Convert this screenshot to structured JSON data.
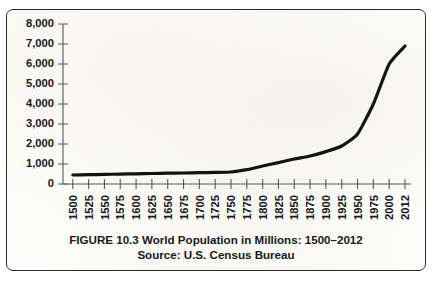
{
  "figure": {
    "caption_title": "FIGURE 10.3 World Population in Millions: 1500–2012",
    "caption_source": "Source: U.S. Census Bureau",
    "border_color": "#2b2b2b",
    "background_color": "#fdfdfb"
  },
  "chart_data": {
    "type": "line",
    "title": "FIGURE 10.3 World Population in Millions: 1500–2012",
    "subtitle": "Source: U.S. Census Bureau",
    "xlabel": "",
    "ylabel": "",
    "grid": false,
    "legend": "none",
    "line_color": "#131313",
    "axis_color": "#555a5c",
    "ylim": [
      0,
      8000
    ],
    "ytick_labels": [
      "8,000",
      "7,000",
      "6,000",
      "5,000",
      "4,000",
      "3,000",
      "2,000",
      "1,000",
      "0"
    ],
    "ytick_values": [
      8000,
      7000,
      6000,
      5000,
      4000,
      3000,
      2000,
      1000,
      0
    ],
    "categories": [
      "1500",
      "1525",
      "1550",
      "1575",
      "1600",
      "1625",
      "1650",
      "1675",
      "1700",
      "1725",
      "1750",
      "1775",
      "1800",
      "1825",
      "1850",
      "1875",
      "1900",
      "1925",
      "1950",
      "1975",
      "2000",
      "2012"
    ],
    "x": [
      1500,
      1525,
      1550,
      1575,
      1600,
      1625,
      1650,
      1675,
      1700,
      1725,
      1750,
      1775,
      1800,
      1825,
      1850,
      1875,
      1900,
      1925,
      1950,
      1975,
      2000,
      2012
    ],
    "values": [
      450,
      465,
      480,
      495,
      510,
      525,
      540,
      550,
      565,
      580,
      600,
      720,
      900,
      1070,
      1250,
      1400,
      1620,
      1900,
      2500,
      4000,
      6000,
      6900
    ],
    "series": [
      {
        "name": "World Population (millions)",
        "values": [
          450,
          465,
          480,
          495,
          510,
          525,
          540,
          550,
          565,
          580,
          600,
          720,
          900,
          1070,
          1250,
          1400,
          1620,
          1900,
          2500,
          4000,
          6000,
          6900
        ]
      }
    ]
  }
}
